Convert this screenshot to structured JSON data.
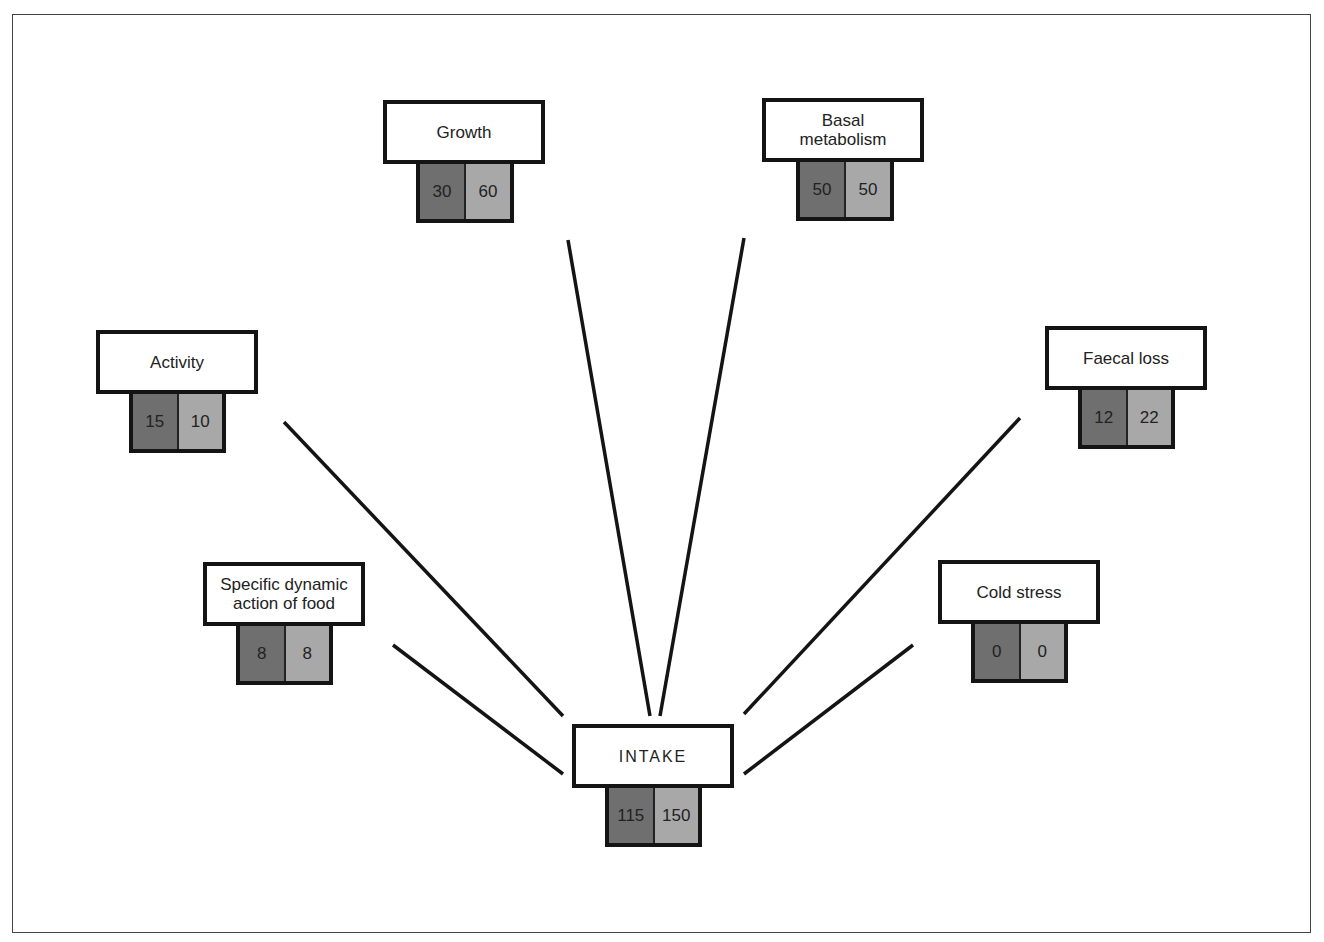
{
  "diagram": {
    "center": {
      "label": "INTAKE",
      "values": [
        "115",
        "150"
      ]
    },
    "nodes": [
      {
        "id": "growth",
        "label": "Growth",
        "values": [
          "30",
          "60"
        ]
      },
      {
        "id": "basal",
        "label": "Basal metabolism",
        "values": [
          "50",
          "50"
        ]
      },
      {
        "id": "activity",
        "label": "Activity",
        "values": [
          "15",
          "10"
        ]
      },
      {
        "id": "faecal",
        "label": "Faecal loss",
        "values": [
          "12",
          "22"
        ]
      },
      {
        "id": "sda",
        "label": "Specific dynamic action of food",
        "values": [
          "8",
          "8"
        ]
      },
      {
        "id": "cold",
        "label": "Cold stress",
        "values": [
          "0",
          "0"
        ]
      }
    ],
    "colors": {
      "dark_value": "#6f6f6f",
      "light_value": "#a8a8a8",
      "border": "#141414"
    }
  }
}
